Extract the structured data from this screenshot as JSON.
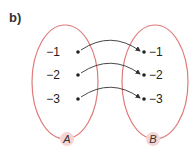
{
  "part_label": "b)",
  "colors": {
    "set_outline": "#e07a7a",
    "label_bg": "#f6d4d4",
    "arrow": "#333333"
  },
  "set_a": {
    "name": "A",
    "elements": [
      "−1",
      "−2",
      "−3"
    ]
  },
  "set_b": {
    "name": "B",
    "elements": [
      "−1",
      "−2",
      "−3"
    ]
  },
  "mappings": [
    {
      "from": "−1",
      "to": "−1"
    },
    {
      "from": "−2",
      "to": "−2"
    },
    {
      "from": "−3",
      "to": "−3"
    }
  ]
}
